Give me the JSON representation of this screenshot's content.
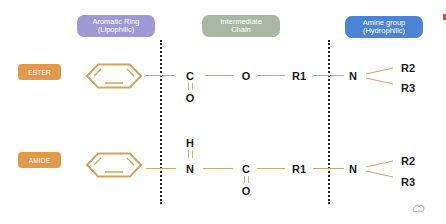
{
  "headers": [
    {
      "line1": "Aromatic Ring",
      "line2": "(Lipophilic)",
      "color": "#9e99d4"
    },
    {
      "line1": "Intermediate",
      "line2": "Chain",
      "color": "#a9b8a4"
    },
    {
      "line1": "Amine group",
      "line2": "(Hydrophilic)",
      "color": "#4b84d4"
    }
  ],
  "rows": [
    {
      "label": "ESTER",
      "label_color": "#e09a4a",
      "carbon": "C",
      "carbonyl_oxygen": "O",
      "linker": "O",
      "r1": "R1",
      "nitrogen": "N",
      "r2": "R2",
      "r3": "R3"
    },
    {
      "label": "AMIDE",
      "label_color": "#e09a4a",
      "hydrogen": "H",
      "linker": "N",
      "carbon": "C",
      "carbonyl_oxygen": "O",
      "r1": "R1",
      "nitrogen": "N",
      "r2": "R2",
      "r3": "R3"
    }
  ],
  "colors": {
    "bond": "#c9a873",
    "ring": "#d0a560",
    "divider": "#222222",
    "atom_text": "#1a1a1a"
  },
  "icons": {
    "corner_mark": "red-corner-mark",
    "watermark": "signature-watermark-icon"
  }
}
